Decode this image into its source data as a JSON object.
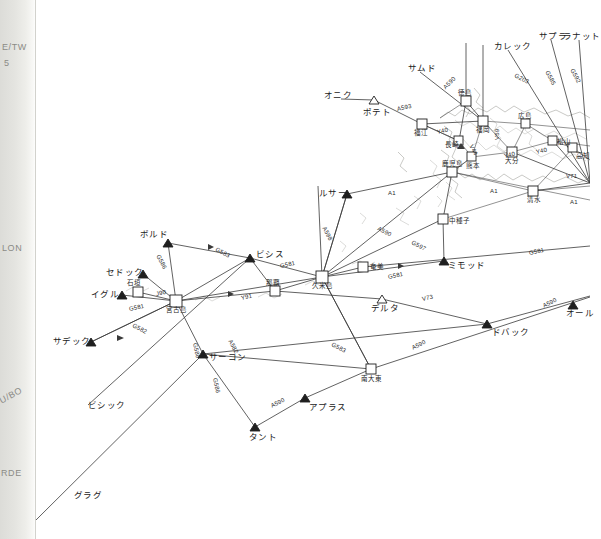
{
  "chart": {
    "background_color": "#ffffff",
    "line_color": "#3a3a3a",
    "coast_color": "#9a9a95",
    "label_color": "#1a1a1a"
  },
  "page_edge": {
    "texts": [
      {
        "text": "E/TW",
        "x": 2,
        "y": 44
      },
      {
        "text": "5",
        "x": 4,
        "y": 60
      },
      {
        "text": "LON",
        "x": 2,
        "y": 245
      },
      {
        "text": "U/BO",
        "x": 0,
        "y": 396
      },
      {
        "text": "RDE",
        "x": 1,
        "y": 470
      }
    ]
  },
  "waypoints": [
    {
      "name": "オニク",
      "romaji": "ONIKU",
      "x": 341,
      "y": 99,
      "symbol": "none",
      "label_dx": -17,
      "label_dy": -4
    },
    {
      "name": "ポテト",
      "romaji": "POTETO",
      "x": 374,
      "y": 100,
      "symbol": "triangle-open",
      "label_dx": -11,
      "label_dy": 12
    },
    {
      "name": "サムド",
      "romaji": "SAMUDO",
      "x": 420,
      "y": 72,
      "symbol": "none",
      "label_dx": -12,
      "label_dy": -4
    },
    {
      "name": "カレック",
      "romaji": "KAREKKU",
      "x": 508,
      "y": 50,
      "symbol": "none",
      "label_dx": -14,
      "label_dy": -4
    },
    {
      "name": "サプラ",
      "romaji": "SAPURA",
      "x": 551,
      "y": 40,
      "symbol": "none",
      "label_dx": -12,
      "label_dy": -4
    },
    {
      "name": "ラナット",
      "romaji": "RANATTO",
      "x": 579,
      "y": 40,
      "symbol": "none",
      "label_dx": -16,
      "label_dy": -4
    },
    {
      "name": "ルサー",
      "romaji": "RUSAA",
      "x": 347,
      "y": 194,
      "symbol": "triangle-solid",
      "label_dx": -28,
      "label_dy": -1
    },
    {
      "name": "ボルド",
      "romaji": "BORUDO",
      "x": 168,
      "y": 243,
      "symbol": "triangle-solid",
      "label_dx": -28,
      "label_dy": -9
    },
    {
      "name": "セドック",
      "romaji": "SEDOKKU",
      "x": 143,
      "y": 274,
      "symbol": "triangle-solid",
      "label_dx": -37,
      "label_dy": -2
    },
    {
      "name": "イグル",
      "romaji": "IGURU",
      "x": 122,
      "y": 295,
      "symbol": "triangle-solid",
      "label_dx": -31,
      "label_dy": -1
    },
    {
      "name": "ビシス",
      "romaji": "BISHISU",
      "x": 250,
      "y": 258,
      "symbol": "triangle-solid",
      "label_dx": 6,
      "label_dy": -4
    },
    {
      "name": "サデック",
      "romaji": "SADEKKU",
      "x": 91,
      "y": 342,
      "symbol": "triangle-solid",
      "label_dx": -38,
      "label_dy": -1
    },
    {
      "name": "ミモッド",
      "romaji": "MIMODDO",
      "x": 444,
      "y": 261,
      "symbol": "triangle-solid",
      "label_dx": 4,
      "label_dy": 4
    },
    {
      "name": "デルタ",
      "romaji": "DERUTA",
      "x": 382,
      "y": 299,
      "symbol": "triangle-open",
      "label_dx": -11,
      "label_dy": 9
    },
    {
      "name": "サーコン",
      "romaji": "SAAKON",
      "x": 203,
      "y": 354,
      "symbol": "triangle-solid",
      "label_dx": 6,
      "label_dy": 3
    },
    {
      "name": "ドバック",
      "romaji": "DOBAKKU",
      "x": 487,
      "y": 324,
      "symbol": "triangle-solid",
      "label_dx": 5,
      "label_dy": 8
    },
    {
      "name": "オール",
      "romaji": "OORU",
      "x": 573,
      "y": 305,
      "symbol": "triangle-solid",
      "label_dx": -7,
      "label_dy": 8
    },
    {
      "name": "アプラス",
      "romaji": "APURASU",
      "x": 305,
      "y": 398,
      "symbol": "triangle-solid",
      "label_dx": 4,
      "label_dy": 9
    },
    {
      "name": "タント",
      "romaji": "TANTO",
      "x": 255,
      "y": 427,
      "symbol": "triangle-solid",
      "label_dx": -6,
      "label_dy": 10
    },
    {
      "name": "ビシック",
      "romaji": "BISHIKKU",
      "x": 88,
      "y": 405,
      "symbol": "none",
      "label_dx": 0,
      "label_dy": 0
    },
    {
      "name": "グラグ",
      "romaji": "GURAGU",
      "x": 74,
      "y": 495,
      "symbol": "none",
      "label_dx": 0,
      "label_dy": 0
    }
  ],
  "airports": [
    {
      "name": "宮古島",
      "romaji": "MIYAKOJIMA",
      "x": 176,
      "y": 301,
      "symbol": "square",
      "label_dx": -10,
      "label_dy": 9
    },
    {
      "name": "石垣",
      "romaji": "ISHIGAKI",
      "x": 138,
      "y": 292,
      "symbol": "square",
      "label_dx": -11,
      "label_dy": -9
    },
    {
      "name": "那覇",
      "romaji": "NAHA",
      "x": 275,
      "y": 291,
      "symbol": "square",
      "label_dx": -9,
      "label_dy": -8
    },
    {
      "name": "久米島",
      "romaji": "KUMEJIMA",
      "x": 322,
      "y": 277,
      "symbol": "square",
      "label_dx": -10,
      "label_dy": 9
    },
    {
      "name": "奄美",
      "romaji": "AMAMI",
      "x": 363,
      "y": 267,
      "symbol": "square",
      "label_dx": 7,
      "label_dy": 0
    },
    {
      "name": "南大東",
      "romaji": "MINAMIDAITO",
      "x": 371,
      "y": 369,
      "symbol": "square",
      "label_dx": -10,
      "label_dy": 10
    },
    {
      "name": "中種子",
      "romaji": "NAKATANE",
      "x": 443,
      "y": 219,
      "symbol": "square",
      "label_dx": 6,
      "label_dy": 2
    },
    {
      "name": "鹿児島",
      "romaji": "KAGOSHIMA",
      "x": 452,
      "y": 172,
      "symbol": "square",
      "label_dx": -10,
      "label_dy": -8
    },
    {
      "name": "福江",
      "romaji": "FUKUE",
      "x": 422,
      "y": 124,
      "symbol": "square",
      "label_dx": -8,
      "label_dy": 9
    },
    {
      "name": "福岡",
      "romaji": "FUKUOKA",
      "x": 483,
      "y": 121,
      "symbol": "square",
      "label_dx": -7,
      "label_dy": 9
    },
    {
      "name": "長崎",
      "romaji": "NAGASAKI",
      "x": 459,
      "y": 141,
      "symbol": "square",
      "label_dx": -14,
      "label_dy": 4
    },
    {
      "name": "熊本",
      "romaji": "KUMAMOTO",
      "x": 472,
      "y": 157,
      "symbol": "square",
      "label_dx": -6,
      "label_dy": 9
    },
    {
      "name": "大分",
      "romaji": "OITA",
      "x": 512,
      "y": 152,
      "symbol": "square",
      "label_dx": -7,
      "label_dy": 9
    },
    {
      "name": "広島",
      "romaji": "HIROSHIMA",
      "x": 526,
      "y": 124,
      "symbol": "square",
      "label_dx": -8,
      "label_dy": -8
    },
    {
      "name": "松山",
      "romaji": "MATSUYAMA",
      "x": 553,
      "y": 141,
      "symbol": "square",
      "label_dx": 4,
      "label_dy": 1
    },
    {
      "name": "高知",
      "romaji": "KOCHI",
      "x": 573,
      "y": 148,
      "symbol": "square",
      "label_dx": 3,
      "label_dy": 8
    },
    {
      "name": "清水",
      "romaji": "SHIMIZU",
      "x": 533,
      "y": 191,
      "symbol": "square",
      "label_dx": -6,
      "label_dy": 9
    },
    {
      "name": "徳島",
      "romaji": "TOKUSHIMA",
      "x": 466,
      "y": 101,
      "symbol": "square",
      "label_dx": -8,
      "label_dy": -8
    }
  ],
  "airways": [
    {
      "code": "A593",
      "x": 397,
      "y": 106,
      "rot": "rot-h"
    },
    {
      "code": "A590",
      "x": 444,
      "y": 85,
      "rot": "rot-e"
    },
    {
      "code": "G203",
      "x": 515,
      "y": 72,
      "rot": "rot-b"
    },
    {
      "code": "G585",
      "x": 547,
      "y": 68,
      "rot": "rot-d"
    },
    {
      "code": "G592",
      "x": 572,
      "y": 66,
      "rot": "rot-d"
    },
    {
      "code": "G583",
      "x": 216,
      "y": 246,
      "rot": "rot-b"
    },
    {
      "code": "G581",
      "x": 280,
      "y": 263,
      "rot": "rot-h"
    },
    {
      "code": "G581",
      "x": 529,
      "y": 250,
      "rot": "rot-h"
    },
    {
      "code": "G581",
      "x": 388,
      "y": 274,
      "rot": "rot-h"
    },
    {
      "code": "G586",
      "x": 158,
      "y": 252,
      "rot": "rot-d"
    },
    {
      "code": "G582",
      "x": 133,
      "y": 322,
      "rot": "rot-b"
    },
    {
      "code": "G581",
      "x": 129,
      "y": 306,
      "rot": "rot-h"
    },
    {
      "code": "J90",
      "x": 156,
      "y": 291,
      "rot": "rot-h"
    },
    {
      "code": "Y91",
      "x": 241,
      "y": 295,
      "rot": "rot-h"
    },
    {
      "code": "A582",
      "x": 230,
      "y": 337,
      "rot": "rot-d"
    },
    {
      "code": "G586",
      "x": 195,
      "y": 340,
      "rot": "rot-g"
    },
    {
      "code": "G586",
      "x": 215,
      "y": 375,
      "rot": "rot-g"
    },
    {
      "code": "G583",
      "x": 332,
      "y": 341,
      "rot": "rot-b"
    },
    {
      "code": "A590",
      "x": 271,
      "y": 403,
      "rot": "rot-a"
    },
    {
      "code": "A590",
      "x": 412,
      "y": 345,
      "rot": "rot-a"
    },
    {
      "code": "A590",
      "x": 543,
      "y": 303,
      "rot": "rot-a"
    },
    {
      "code": "V73",
      "x": 422,
      "y": 296,
      "rot": "rot-h"
    },
    {
      "code": "A598",
      "x": 324,
      "y": 224,
      "rot": "rot-d"
    },
    {
      "code": "A590",
      "x": 378,
      "y": 225,
      "rot": "rot-b"
    },
    {
      "code": "G597",
      "x": 412,
      "y": 239,
      "rot": "rot-b"
    },
    {
      "code": "A1",
      "x": 388,
      "y": 190,
      "rot": ""
    },
    {
      "code": "A1",
      "x": 490,
      "y": 188,
      "rot": ""
    },
    {
      "code": "A1",
      "x": 570,
      "y": 199,
      "rot": ""
    },
    {
      "code": "V71",
      "x": 566,
      "y": 173,
      "rot": ""
    },
    {
      "code": "Y40",
      "x": 437,
      "y": 129,
      "rot": "rot-h"
    },
    {
      "code": "Y40",
      "x": 504,
      "y": 153,
      "rot": "rot-h"
    },
    {
      "code": "Y40",
      "x": 536,
      "y": 149,
      "rot": "rot-h"
    },
    {
      "code": "V59",
      "x": 497,
      "y": 137,
      "rot": "rot-v"
    },
    {
      "code": "V44",
      "x": 471,
      "y": 142,
      "rot": "rot-d"
    }
  ],
  "legend": {
    "symbols": [
      {
        "glyph": "triangle-solid",
        "meaning": "compulsory-reporting-point"
      },
      {
        "glyph": "triangle-open",
        "meaning": "non-compulsory-reporting-point"
      },
      {
        "glyph": "square",
        "meaning": "airport-navaid"
      }
    ]
  }
}
